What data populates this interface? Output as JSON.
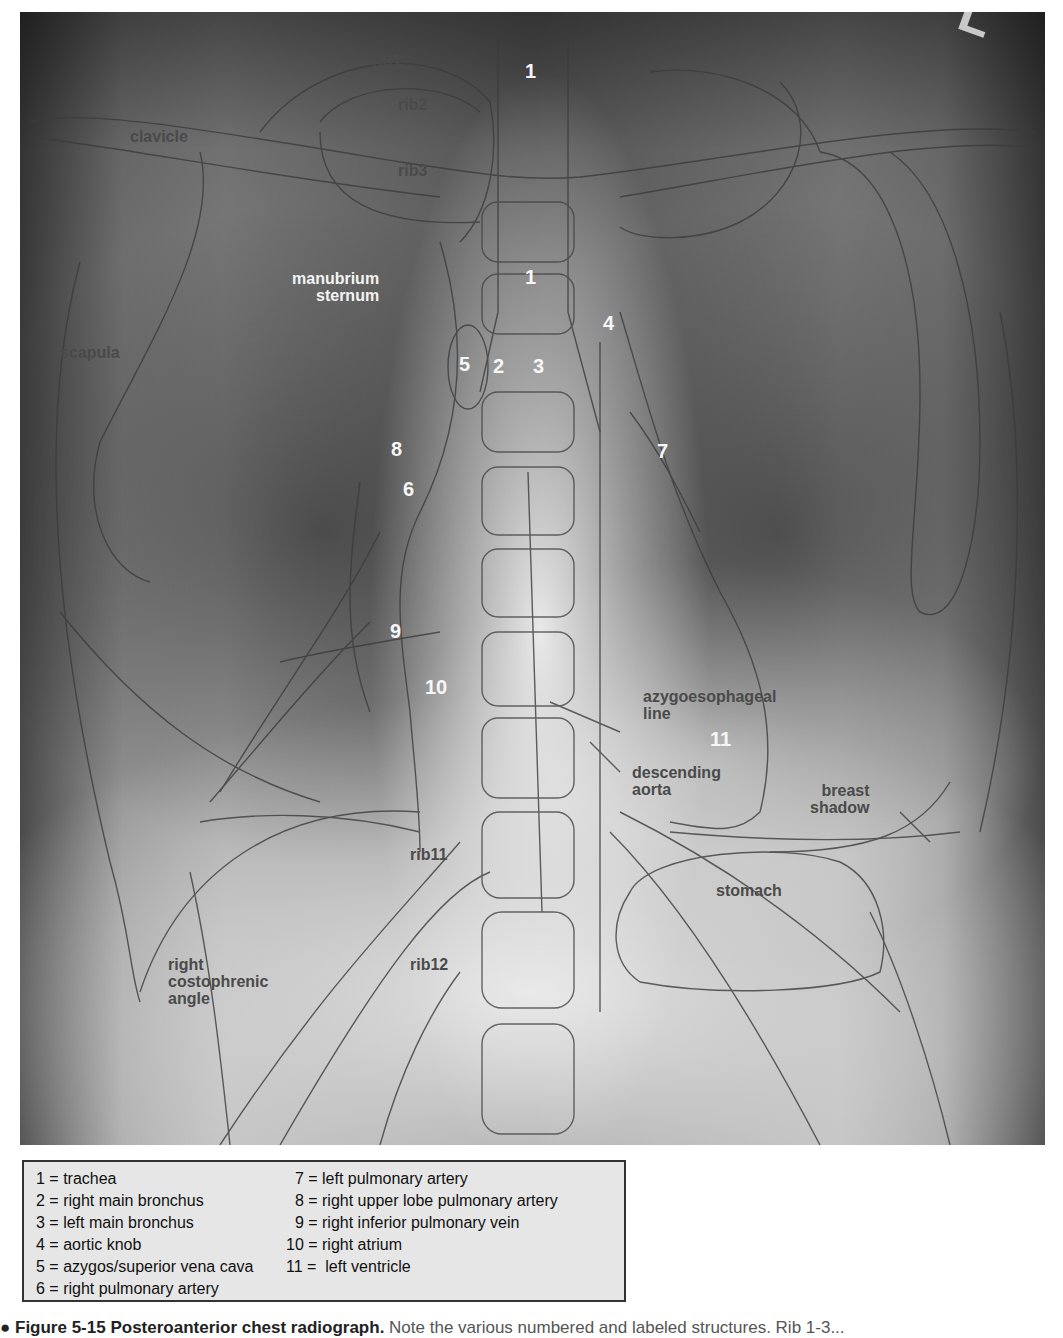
{
  "figure": {
    "corner_marker": "L",
    "anatomy_labels": [
      {
        "id": "rib1",
        "text": "rib1",
        "x": 372,
        "y": 52,
        "color": "dark"
      },
      {
        "id": "rib2",
        "text": "rib2",
        "x": 398,
        "y": 96,
        "color": "dark"
      },
      {
        "id": "rib3",
        "text": "rib3",
        "x": 398,
        "y": 162,
        "color": "dark"
      },
      {
        "id": "clavicle",
        "text": "clavicle",
        "x": 110,
        "y": 128,
        "color": "dark"
      },
      {
        "id": "manubrium",
        "text": "manubrium\nsternum",
        "x": 275,
        "y": 262,
        "color": "light"
      },
      {
        "id": "scapula",
        "text": "scapula",
        "x": 42,
        "y": 337,
        "color": "dark"
      },
      {
        "id": "azygoesophageal",
        "text": "azygoesophageal\nline",
        "x": 625,
        "y": 680,
        "color": "dark"
      },
      {
        "id": "descending-aorta",
        "text": "descending\naorta",
        "x": 613,
        "y": 753,
        "color": "dark"
      },
      {
        "id": "breast-shadow",
        "text": "breast\nshadow",
        "x": 792,
        "y": 772,
        "color": "dark"
      },
      {
        "id": "rib11",
        "text": "rib11",
        "x": 392,
        "y": 842,
        "color": "dark"
      },
      {
        "id": "stomach",
        "text": "stomach",
        "x": 697,
        "y": 872,
        "color": "dark"
      },
      {
        "id": "rib12",
        "text": "rib12",
        "x": 392,
        "y": 945,
        "color": "dark"
      },
      {
        "id": "right-costophrenic-angle",
        "text": "right\ncostophrenic\nangle",
        "x": 150,
        "y": 945,
        "color": "dark"
      }
    ],
    "number_markers": [
      {
        "n": "1",
        "x": 505,
        "y": 58
      },
      {
        "n": "1",
        "x": 505,
        "y": 262
      },
      {
        "n": "4",
        "x": 583,
        "y": 310
      },
      {
        "n": "5",
        "x": 439,
        "y": 350
      },
      {
        "n": "2",
        "x": 473,
        "y": 352
      },
      {
        "n": "3",
        "x": 513,
        "y": 352
      },
      {
        "n": "8",
        "x": 371,
        "y": 435
      },
      {
        "n": "7",
        "x": 637,
        "y": 438
      },
      {
        "n": "6",
        "x": 383,
        "y": 476
      },
      {
        "n": "9",
        "x": 370,
        "y": 618
      },
      {
        "n": "10",
        "x": 405,
        "y": 674
      },
      {
        "n": "11",
        "x": 690,
        "y": 725
      }
    ]
  },
  "legend": {
    "left": [
      "1 = trachea",
      "2 = right main bronchus",
      "3 = left main bronchus",
      "4 = aortic knob",
      "5 = azygos/superior vena cava",
      "6 = right pulmonary artery"
    ],
    "right": [
      "  7 = left pulmonary artery",
      "  8 = right upper lobe pulmonary artery",
      "  9 = right inferior pulmonary vein",
      "10 = right atrium",
      "11 =  left ventricle"
    ]
  },
  "caption": {
    "title": "● Figure 5-15  Posteroanterior chest radiograph.",
    "rest": " Note the various numbered and labeled structures. Rib 1-3..."
  }
}
